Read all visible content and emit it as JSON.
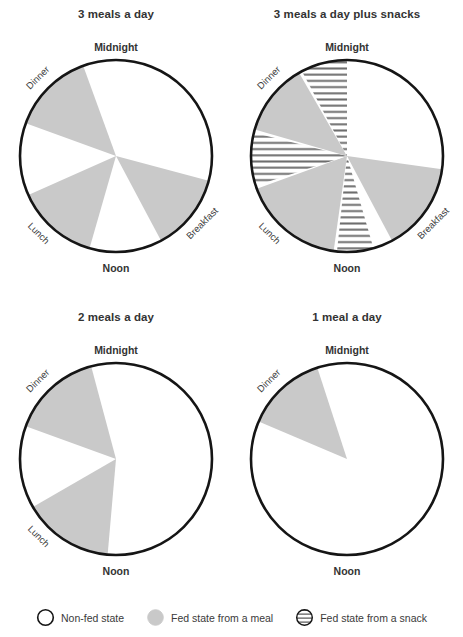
{
  "page": {
    "background": "#ffffff",
    "meal_color": "#c9c9c9",
    "snack_color": "#ffffff",
    "snack_stripe_color": "#6e6e6e",
    "nonfed_color": "#ffffff",
    "outline_color": "#151515"
  },
  "legend": {
    "items": [
      {
        "swatch": "open-circle-swatch",
        "label": "Non-fed state"
      },
      {
        "swatch": "gray-circle-swatch",
        "label": "Fed state from a meal"
      },
      {
        "swatch": "hatched-circle-swatch",
        "label": "Fed state from a snack"
      }
    ]
  },
  "chart_data": [
    {
      "id": "three-meals-a-day",
      "type": "pie",
      "title": "3 meals a day",
      "axis_labels": {
        "top": "Midnight",
        "bottom": "Noon"
      },
      "clock_hours": 24,
      "note": "Angles measured clockwise from Midnight at top (0 deg = midnight, 180 deg = noon)",
      "sector_labels": [
        {
          "name": "Breakfast",
          "angle_deg": 128,
          "rotate_deg": -45
        },
        {
          "name": "Lunch",
          "angle_deg": 225,
          "rotate_deg": 45
        },
        {
          "name": "Dinner",
          "angle_deg": 315,
          "rotate_deg": -45
        }
      ],
      "sectors": [
        {
          "label": "Breakfast",
          "state": "meal",
          "start_deg": 105,
          "end_deg": 152
        },
        {
          "label": "Lunch",
          "state": "meal",
          "start_deg": 196,
          "end_deg": 246
        },
        {
          "label": "Dinner",
          "state": "meal",
          "start_deg": 290,
          "end_deg": 340
        }
      ]
    },
    {
      "id": "three-meals-a-day-plus-snacks",
      "type": "pie",
      "title": "3 meals a day plus snacks",
      "axis_labels": {
        "top": "Midnight",
        "bottom": "Noon"
      },
      "clock_hours": 24,
      "note": "Angles measured clockwise from Midnight at top (0 deg = midnight, 180 deg = noon)",
      "sector_labels": [
        {
          "name": "Breakfast",
          "angle_deg": 128,
          "rotate_deg": -45
        },
        {
          "name": "Lunch",
          "angle_deg": 225,
          "rotate_deg": 45
        },
        {
          "name": "Dinner",
          "angle_deg": 315,
          "rotate_deg": -45
        }
      ],
      "sectors": [
        {
          "label": "Breakfast",
          "state": "meal",
          "start_deg": 98,
          "end_deg": 152
        },
        {
          "label": "Snack (afternoon)",
          "state": "snack",
          "start_deg": 164,
          "end_deg": 186
        },
        {
          "label": "Lunch",
          "state": "meal",
          "start_deg": 188,
          "end_deg": 250
        },
        {
          "label": "Snack (late afternoon)",
          "state": "snack",
          "start_deg": 252,
          "end_deg": 284
        },
        {
          "label": "Dinner",
          "state": "meal",
          "start_deg": 286,
          "end_deg": 330
        },
        {
          "label": "Snack (evening)",
          "state": "snack",
          "start_deg": 332,
          "end_deg": 360
        }
      ]
    },
    {
      "id": "two-meals-a-day",
      "type": "pie",
      "title": "2 meals a day",
      "axis_labels": {
        "top": "Midnight",
        "bottom": "Noon"
      },
      "clock_hours": 24,
      "note": "Angles measured clockwise from Midnight at top (0 deg = midnight, 180 deg = noon)",
      "sector_labels": [
        {
          "name": "Lunch",
          "angle_deg": 225,
          "rotate_deg": 45
        },
        {
          "name": "Dinner",
          "angle_deg": 315,
          "rotate_deg": -45
        }
      ],
      "sectors": [
        {
          "label": "Lunch",
          "state": "meal",
          "start_deg": 185,
          "end_deg": 240
        },
        {
          "label": "Dinner",
          "state": "meal",
          "start_deg": 290,
          "end_deg": 345
        }
      ]
    },
    {
      "id": "one-meal-a-day",
      "type": "pie",
      "title": "1 meal a day",
      "axis_labels": {
        "top": "Midnight",
        "bottom": "Noon"
      },
      "clock_hours": 24,
      "note": "Angles measured clockwise from Midnight at top (0 deg = midnight, 180 deg = noon)",
      "sector_labels": [
        {
          "name": "Dinner",
          "angle_deg": 315,
          "rotate_deg": -45
        }
      ],
      "sectors": [
        {
          "label": "Dinner",
          "state": "meal",
          "start_deg": 293,
          "end_deg": 342
        }
      ]
    }
  ]
}
